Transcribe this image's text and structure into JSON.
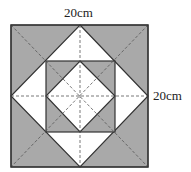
{
  "diagram": {
    "top_label": "20cm",
    "right_label": "20cm",
    "colors": {
      "shade": "#a9a9a9",
      "line": "#333333",
      "dash": "#555555",
      "white": "#ffffff"
    }
  }
}
